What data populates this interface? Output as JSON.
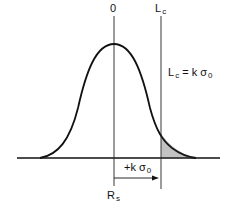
{
  "diagram": {
    "title": "",
    "labels": {
      "center_top": "0",
      "limit_top_main": "L",
      "limit_top_sub": "c",
      "equation_lhs_main": "L",
      "equation_lhs_sub": "c",
      "equation_rhs_main": "= k σ",
      "equation_rhs_sub": "0",
      "offset_main": "+k σ",
      "offset_sub": "0",
      "center_bottom_main": "R",
      "center_bottom_sub": "s"
    },
    "elements": {
      "curve": "normal distribution (bell curve) centered at 0",
      "shaded_region": "right tail beyond Lc (hatched)",
      "arrow": "from Rs/0 line to Lc line, labeled +kσ0"
    },
    "colors": {
      "stroke": "#111111",
      "background": "#ffffff"
    }
  }
}
